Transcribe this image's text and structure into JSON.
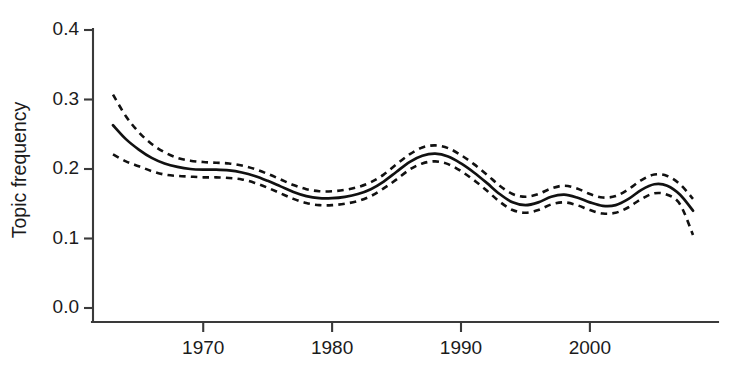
{
  "chart_data": {
    "type": "line",
    "title": "",
    "subtitle": "",
    "xlabel": "",
    "ylabel": "Topic frequency",
    "xlim": [
      1963,
      2008
    ],
    "ylim": [
      0.0,
      0.4
    ],
    "grid": false,
    "legend": null,
    "x_ticks": [
      1970,
      1980,
      1990,
      2000
    ],
    "x_tick_labels": [
      "1970",
      "1980",
      "1990",
      "2000"
    ],
    "y_ticks": [
      0.0,
      0.1,
      0.2,
      0.3,
      0.4
    ],
    "y_tick_labels": [
      "0.0",
      "0.1",
      "0.2",
      "0.3",
      "0.4"
    ],
    "x": [
      1963,
      1964,
      1965,
      1966,
      1967,
      1968,
      1969,
      1970,
      1971,
      1972,
      1973,
      1974,
      1975,
      1976,
      1977,
      1978,
      1979,
      1980,
      1981,
      1982,
      1983,
      1984,
      1985,
      1986,
      1987,
      1988,
      1989,
      1990,
      1991,
      1992,
      1993,
      1994,
      1995,
      1996,
      1997,
      1998,
      1999,
      2000,
      2001,
      2002,
      2003,
      2004,
      2005,
      2006,
      2007,
      2008
    ],
    "series": [
      {
        "name": "fitted trend",
        "style": "solid",
        "color": "#111111",
        "values": [
          0.263,
          0.243,
          0.228,
          0.216,
          0.208,
          0.203,
          0.2,
          0.199,
          0.199,
          0.198,
          0.195,
          0.19,
          0.183,
          0.175,
          0.167,
          0.161,
          0.158,
          0.158,
          0.16,
          0.164,
          0.171,
          0.182,
          0.196,
          0.21,
          0.219,
          0.222,
          0.218,
          0.208,
          0.195,
          0.18,
          0.164,
          0.152,
          0.148,
          0.152,
          0.16,
          0.163,
          0.159,
          0.152,
          0.147,
          0.148,
          0.157,
          0.17,
          0.178,
          0.176,
          0.163,
          0.14
        ]
      },
      {
        "name": "upper confidence bound",
        "style": "dashed",
        "color": "#111111",
        "values": [
          0.307,
          0.276,
          0.253,
          0.236,
          0.224,
          0.216,
          0.212,
          0.21,
          0.209,
          0.208,
          0.205,
          0.2,
          0.193,
          0.185,
          0.177,
          0.171,
          0.168,
          0.168,
          0.17,
          0.174,
          0.181,
          0.192,
          0.207,
          0.221,
          0.231,
          0.234,
          0.23,
          0.22,
          0.207,
          0.192,
          0.176,
          0.164,
          0.16,
          0.164,
          0.172,
          0.176,
          0.172,
          0.164,
          0.159,
          0.161,
          0.171,
          0.184,
          0.192,
          0.19,
          0.178,
          0.157
        ]
      },
      {
        "name": "lower confidence bound",
        "style": "dashed",
        "color": "#111111",
        "values": [
          0.221,
          0.211,
          0.204,
          0.197,
          0.192,
          0.19,
          0.189,
          0.188,
          0.188,
          0.187,
          0.185,
          0.18,
          0.173,
          0.165,
          0.157,
          0.151,
          0.148,
          0.148,
          0.15,
          0.154,
          0.161,
          0.172,
          0.185,
          0.199,
          0.208,
          0.211,
          0.207,
          0.197,
          0.184,
          0.169,
          0.153,
          0.141,
          0.137,
          0.141,
          0.149,
          0.152,
          0.148,
          0.141,
          0.136,
          0.137,
          0.145,
          0.157,
          0.165,
          0.163,
          0.149,
          0.105
        ]
      }
    ]
  }
}
